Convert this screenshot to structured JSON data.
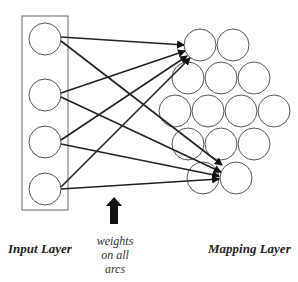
{
  "diagram": {
    "type": "neural-network-mapping",
    "input_layer": {
      "label": "Input Layer",
      "node_count": 4
    },
    "mapping_layer": {
      "label": "Mapping Layer",
      "node_count": 14,
      "rows": [
        2,
        3,
        4,
        3,
        2
      ]
    },
    "annotation": {
      "lines": [
        "weights",
        "on all",
        "arcs"
      ]
    },
    "connections": [
      {
        "from": 0,
        "to": 0
      },
      {
        "from": 0,
        "to": 13
      },
      {
        "from": 1,
        "to": 0
      },
      {
        "from": 1,
        "to": 13
      },
      {
        "from": 2,
        "to": 0
      },
      {
        "from": 2,
        "to": 13
      },
      {
        "from": 3,
        "to": 0
      },
      {
        "from": 3,
        "to": 13
      }
    ],
    "colors": {
      "stroke": "#222222",
      "node_stroke": "#555555",
      "box_stroke": "#666666"
    }
  }
}
